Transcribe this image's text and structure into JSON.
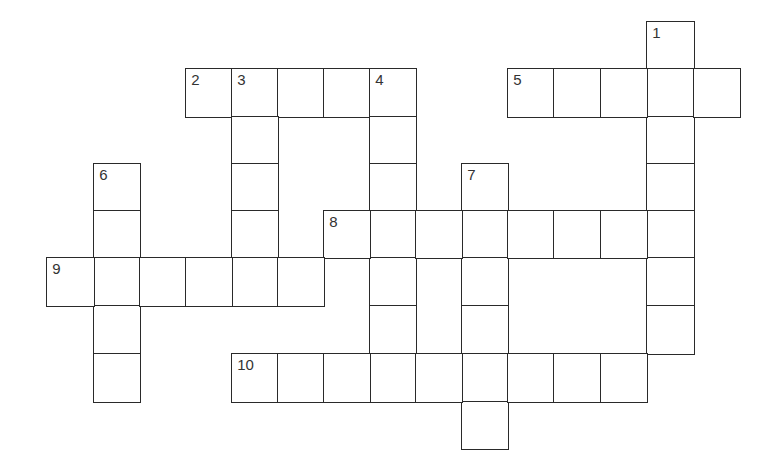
{
  "puzzle": {
    "type": "crossword",
    "geometry": {
      "col_edges": [
        47,
        94,
        140,
        186,
        232,
        278,
        324,
        370,
        416,
        462,
        508,
        554,
        601,
        647,
        694,
        740
      ],
      "row_edges": [
        22,
        69,
        117,
        164,
        211,
        258,
        306,
        354,
        402,
        449
      ]
    },
    "colors": {
      "line": "#2a2a2a",
      "number": "#333333",
      "background": "#ffffff"
    },
    "entries": [
      {
        "number": "1",
        "direction": "down",
        "row": 0,
        "col": 13,
        "length": 7
      },
      {
        "number": "2",
        "direction": "across",
        "row": 1,
        "col": 3,
        "length": 5
      },
      {
        "number": "3",
        "direction": "down",
        "row": 1,
        "col": 4,
        "length": 5
      },
      {
        "number": "4",
        "direction": "down",
        "row": 1,
        "col": 7,
        "length": 7
      },
      {
        "number": "5",
        "direction": "across",
        "row": 1,
        "col": 10,
        "length": 5
      },
      {
        "number": "6",
        "direction": "down",
        "row": 3,
        "col": 1,
        "length": 5
      },
      {
        "number": "7",
        "direction": "down",
        "row": 3,
        "col": 9,
        "length": 6
      },
      {
        "number": "8",
        "direction": "across",
        "row": 4,
        "col": 6,
        "length": 8
      },
      {
        "number": "9",
        "direction": "across",
        "row": 5,
        "col": 0,
        "length": 6
      },
      {
        "number": "10",
        "direction": "across",
        "row": 7,
        "col": 4,
        "length": 9
      }
    ]
  }
}
